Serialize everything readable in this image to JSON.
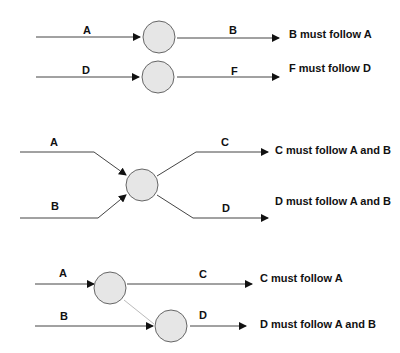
{
  "colors": {
    "background": "#ffffff",
    "edge": "#444444",
    "edge_light": "#bbbbbb",
    "node_fill": "#e6e6e6",
    "node_stroke": "#666666",
    "text": "#111111"
  },
  "sections": [
    {
      "name": "sequential",
      "rows": [
        {
          "in_label": "A",
          "out_label": "B",
          "rule": "B must follow A"
        },
        {
          "in_label": "D",
          "out_label": "F",
          "rule": "F must follow D"
        }
      ]
    },
    {
      "name": "join-split",
      "in_labels": [
        "A",
        "B"
      ],
      "out_labels": [
        "C",
        "D"
      ],
      "rules": [
        "C must follow A and B",
        "D must follow A and B"
      ]
    },
    {
      "name": "partial-join",
      "in_labels": [
        "A",
        "B"
      ],
      "out_labels": [
        "C",
        "D"
      ],
      "rules": [
        "C must follow A",
        "D must follow A and B"
      ]
    }
  ]
}
